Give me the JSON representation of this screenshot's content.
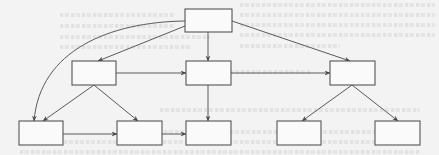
{
  "diagram": {
    "type": "flowchart",
    "colors": {
      "background": "#f3f3f3",
      "box_fill": "#fafafa",
      "box_stroke": "#555555",
      "edge": "#5a5a5a"
    },
    "nodes": [
      {
        "id": "root",
        "label": "",
        "x": 185,
        "y": 9,
        "w": 47,
        "h": 23
      },
      {
        "id": "mid-left",
        "label": "",
        "x": 72,
        "y": 61,
        "w": 44,
        "h": 24
      },
      {
        "id": "mid-center",
        "label": "",
        "x": 186,
        "y": 61,
        "w": 45,
        "h": 24
      },
      {
        "id": "mid-right",
        "label": "",
        "x": 330,
        "y": 61,
        "w": 45,
        "h": 24
      },
      {
        "id": "bottom-1",
        "label": "",
        "x": 19,
        "y": 121,
        "w": 44,
        "h": 24
      },
      {
        "id": "bottom-2",
        "label": "",
        "x": 117,
        "y": 121,
        "w": 45,
        "h": 24
      },
      {
        "id": "bottom-3",
        "label": "",
        "x": 186,
        "y": 121,
        "w": 45,
        "h": 24
      },
      {
        "id": "bottom-4",
        "label": "",
        "x": 277,
        "y": 121,
        "w": 44,
        "h": 24
      },
      {
        "id": "bottom-5",
        "label": "",
        "x": 375,
        "y": 121,
        "w": 45,
        "h": 24
      }
    ],
    "edges": [
      {
        "from": "root",
        "to": "bottom-1",
        "shape": "curve"
      },
      {
        "from": "root",
        "to": "mid-left",
        "shape": "straight"
      },
      {
        "from": "root",
        "to": "mid-center",
        "shape": "straight"
      },
      {
        "from": "root",
        "to": "mid-right",
        "shape": "straight"
      },
      {
        "from": "mid-left",
        "to": "mid-center",
        "shape": "straight"
      },
      {
        "from": "mid-center",
        "to": "mid-right",
        "shape": "straight"
      },
      {
        "from": "mid-left",
        "to": "bottom-1",
        "shape": "straight"
      },
      {
        "from": "mid-left",
        "to": "bottom-2",
        "shape": "straight"
      },
      {
        "from": "mid-center",
        "to": "bottom-3",
        "shape": "straight"
      },
      {
        "from": "bottom-1",
        "to": "bottom-2",
        "shape": "straight"
      },
      {
        "from": "bottom-2",
        "to": "bottom-3",
        "shape": "straight"
      },
      {
        "from": "mid-right",
        "to": "bottom-4",
        "shape": "straight"
      },
      {
        "from": "mid-right",
        "to": "bottom-5",
        "shape": "straight"
      }
    ]
  }
}
